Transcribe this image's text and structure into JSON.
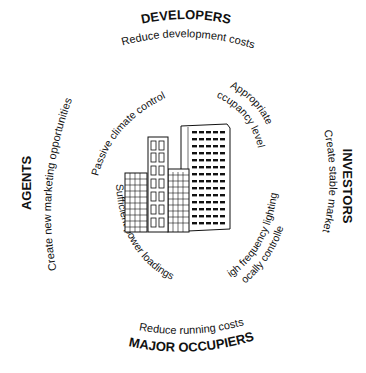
{
  "diagram": {
    "center": "office-building-illustration",
    "stakeholders": [
      {
        "id": "developers",
        "label": "DEVELOPERS",
        "goal": "Reduce development costs",
        "position": "top"
      },
      {
        "id": "investors",
        "label": "INVESTORS",
        "goal": "Create stable market",
        "position": "right"
      },
      {
        "id": "occupiers",
        "label": "MAJOR OCCUPIERS",
        "goal": "Reduce running costs",
        "position": "bottom"
      },
      {
        "id": "agents",
        "label": "AGENTS",
        "goal": "Create new marketing opportunities",
        "position": "left"
      }
    ],
    "requirements": [
      {
        "label": "Passive climate control",
        "position": "top-left"
      },
      {
        "label": "Appropriate",
        "label2": "occupancy levels",
        "position": "top-right"
      },
      {
        "label": "High frequency lighting,",
        "label2": "locally controlled",
        "position": "bottom-right"
      },
      {
        "label": "Sufficient power loadings",
        "position": "bottom-left"
      }
    ],
    "colors": {
      "ink": "#111111",
      "background": "#ffffff"
    }
  }
}
